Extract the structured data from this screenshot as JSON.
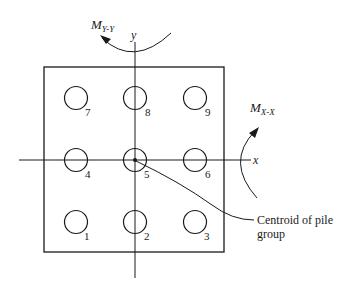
{
  "figure": {
    "type": "pile group plan view",
    "axes": {
      "x_label": "x",
      "y_label": "y"
    },
    "moments": [
      {
        "id": "myy",
        "symbol": "M",
        "subscript": "Y-Y"
      },
      {
        "id": "mxx",
        "symbol": "M",
        "subscript": "X-X"
      }
    ],
    "piles": [
      {
        "label": "7",
        "row": 0,
        "col": 0
      },
      {
        "label": "8",
        "row": 0,
        "col": 1
      },
      {
        "label": "9",
        "row": 0,
        "col": 2
      },
      {
        "label": "4",
        "row": 1,
        "col": 0
      },
      {
        "label": "5",
        "row": 1,
        "col": 1
      },
      {
        "label": "6",
        "row": 1,
        "col": 2
      },
      {
        "label": "1",
        "row": 2,
        "col": 0
      },
      {
        "label": "2",
        "row": 2,
        "col": 1
      },
      {
        "label": "3",
        "row": 2,
        "col": 2
      }
    ],
    "callout": {
      "line1": "Centroid of pile",
      "line2": "group"
    },
    "colors": {
      "stroke": "#1a1a1a",
      "background": "#ffffff"
    }
  }
}
